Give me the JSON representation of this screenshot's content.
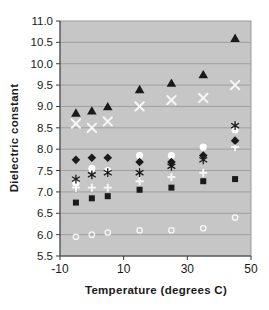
{
  "chart": {
    "ylabel": "Dielectric constant",
    "xlabel": "Temperature (degrees C)"
  },
  "chart_data": {
    "type": "scatter",
    "title": "",
    "xlabel": "Temperature (degrees C)",
    "ylabel": "Dielectric constant",
    "xlim": [
      -10,
      50
    ],
    "ylim": [
      5.5,
      11.0
    ],
    "x_ticks": [
      -10,
      10,
      30,
      50
    ],
    "x_tick_labels": [
      "-10",
      "10",
      "30",
      "50"
    ],
    "y_ticks": [
      5.5,
      6.0,
      6.5,
      7.0,
      7.5,
      8.0,
      8.5,
      9.0,
      9.5,
      10.0,
      10.5,
      11.0
    ],
    "grid": true,
    "legend_position": "none",
    "colors": {
      "plot_background": "#c6c6c6",
      "gridline": "#9f9f9f",
      "plot_border": "#999999",
      "axis_line": "#3a3a3a",
      "tick_text": "#1a1a1a",
      "dark_marker": "#1a1a1a",
      "light_marker": "#f7f7f7"
    },
    "x": [
      -5,
      0,
      5,
      15,
      25,
      35,
      45
    ],
    "series": [
      {
        "name": "white-circle-series",
        "marker": "circle",
        "color": "#ffffff",
        "values": [
          7.2,
          7.55,
          7.5,
          7.85,
          7.85,
          8.05,
          8.45
        ]
      },
      {
        "name": "white-plus-series",
        "marker": "plus",
        "color": "#f7f7f7",
        "values": [
          7.1,
          7.1,
          7.1,
          7.25,
          7.35,
          7.45,
          8.05
        ]
      },
      {
        "name": "white-x-series",
        "marker": "x",
        "color": "#f7f7f7",
        "values": [
          8.6,
          8.5,
          8.65,
          9.0,
          9.15,
          9.2,
          9.5
        ]
      },
      {
        "name": "black-square-series",
        "marker": "square",
        "color": "#1a1a1a",
        "values": [
          6.75,
          6.85,
          6.9,
          7.05,
          7.1,
          7.25,
          7.3
        ]
      },
      {
        "name": "black-diamond-series",
        "marker": "diamond",
        "color": "#1a1a1a",
        "values": [
          7.75,
          7.8,
          7.8,
          7.7,
          7.7,
          7.85,
          8.2
        ]
      },
      {
        "name": "black-asterisk-series",
        "marker": "asterisk",
        "color": "#1a1a1a",
        "values": [
          7.3,
          7.4,
          7.45,
          7.45,
          7.6,
          7.75,
          8.55
        ]
      },
      {
        "name": "black-triangle-series",
        "marker": "triangle",
        "color": "#1a1a1a",
        "values": [
          8.85,
          8.9,
          9.0,
          9.4,
          9.55,
          9.75,
          10.6
        ]
      },
      {
        "name": "open-circle-series",
        "marker": "open-circle",
        "color": "#f7f7f7",
        "values": [
          5.95,
          6.0,
          6.05,
          6.1,
          6.1,
          6.15,
          6.4
        ]
      }
    ]
  }
}
